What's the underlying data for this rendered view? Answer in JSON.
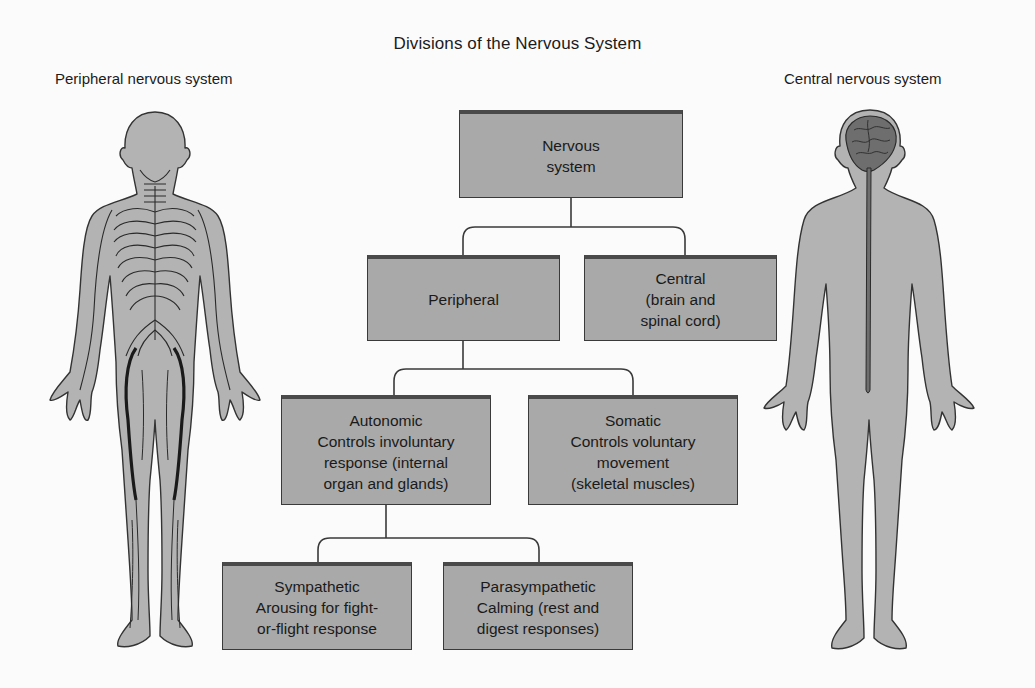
{
  "title": "Divisions of the Nervous System",
  "figures": {
    "left_label": "Peripheral nervous system",
    "right_label": "Central nervous system"
  },
  "nodes": {
    "nervous_system": {
      "lines": [
        "Nervous",
        "system"
      ]
    },
    "peripheral": {
      "lines": [
        "Peripheral"
      ]
    },
    "central": {
      "lines": [
        "Central",
        "(brain and",
        "spinal cord)"
      ]
    },
    "autonomic": {
      "lines": [
        "Autonomic",
        "Controls involuntary",
        "response (internal",
        "organ and glands)"
      ]
    },
    "somatic": {
      "lines": [
        "Somatic",
        "Controls voluntary",
        "movement",
        "(skeletal muscles)"
      ]
    },
    "sympathetic": {
      "lines": [
        "Sympathetic",
        "Arousing for fight-",
        "or-flight response"
      ]
    },
    "parasympathetic": {
      "lines": [
        "Parasympathetic",
        "Calming (rest and",
        "digest responses)"
      ]
    }
  },
  "hierarchy": [
    {
      "parent": "nervous_system",
      "children": [
        "peripheral",
        "central"
      ]
    },
    {
      "parent": "peripheral",
      "children": [
        "autonomic",
        "somatic"
      ]
    },
    {
      "parent": "autonomic",
      "children": [
        "sympathetic",
        "parasympathetic"
      ]
    }
  ],
  "colors": {
    "box_fill": "#a9a9a9",
    "box_border": "#3a3a3a",
    "body_fill": "#b3b3b3",
    "brain_fill": "#6e6e6e",
    "nerve_stroke": "#2a2a2a",
    "background": "#fbfbfb"
  }
}
